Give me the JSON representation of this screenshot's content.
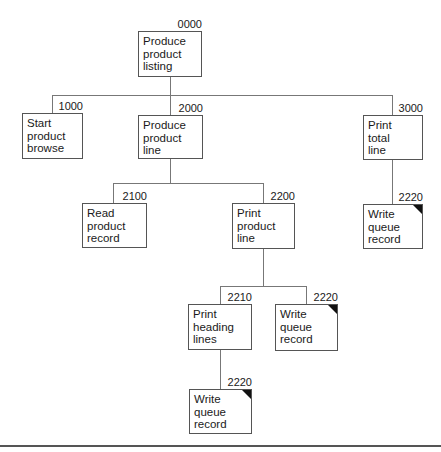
{
  "diagram": {
    "type": "structure-chart",
    "nodes": [
      {
        "id": "root",
        "number": "0000",
        "label": "Produce\nproduct\nlisting",
        "x": 138,
        "y": 31,
        "w": 64,
        "h": 46,
        "shared": false
      },
      {
        "id": "n1000",
        "number": "1000",
        "label": "Start\nproduct\nbrowse",
        "x": 22,
        "y": 113,
        "w": 61,
        "h": 46,
        "shared": false
      },
      {
        "id": "n2000",
        "number": "2000",
        "label": "Produce\nproduct\nline",
        "x": 138,
        "y": 115,
        "w": 65,
        "h": 44,
        "shared": false
      },
      {
        "id": "n3000",
        "number": "3000",
        "label": "Print\ntotal\nline",
        "x": 363,
        "y": 115,
        "w": 60,
        "h": 45,
        "shared": false
      },
      {
        "id": "n2220a",
        "number": "2220",
        "label": "Write\nqueue\nrecord",
        "x": 363,
        "y": 204,
        "w": 60,
        "h": 45,
        "shared": true
      },
      {
        "id": "n2100",
        "number": "2100",
        "label": "Read\nproduct\nrecord",
        "x": 82,
        "y": 203,
        "w": 65,
        "h": 45,
        "shared": false
      },
      {
        "id": "n2200",
        "number": "2200",
        "label": "Print\nproduct\nline",
        "x": 232,
        "y": 203,
        "w": 63,
        "h": 46,
        "shared": false
      },
      {
        "id": "n2210",
        "number": "2210",
        "label": "Print\nheading\nlines",
        "x": 188,
        "y": 304,
        "w": 64,
        "h": 46,
        "shared": false
      },
      {
        "id": "n2220b",
        "number": "2220",
        "label": "Write\nqueue\nrecord",
        "x": 275,
        "y": 304,
        "w": 63,
        "h": 47,
        "shared": true
      },
      {
        "id": "n2220c",
        "number": "2220",
        "label": "Write\nqueue\nrecord",
        "x": 189,
        "y": 389,
        "w": 63,
        "h": 45,
        "shared": true
      }
    ],
    "lines": [
      {
        "x": 170,
        "y": 77,
        "w": 1,
        "h": 18
      },
      {
        "x": 52,
        "y": 95,
        "w": 341,
        "h": 1
      },
      {
        "x": 52,
        "y": 95,
        "w": 1,
        "h": 18
      },
      {
        "x": 170,
        "y": 95,
        "w": 1,
        "h": 20
      },
      {
        "x": 392,
        "y": 95,
        "w": 1,
        "h": 20
      },
      {
        "x": 392,
        "y": 160,
        "w": 1,
        "h": 44
      },
      {
        "x": 170,
        "y": 159,
        "w": 1,
        "h": 24
      },
      {
        "x": 113,
        "y": 183,
        "w": 151,
        "h": 1
      },
      {
        "x": 113,
        "y": 183,
        "w": 1,
        "h": 20
      },
      {
        "x": 263,
        "y": 183,
        "w": 1,
        "h": 20
      },
      {
        "x": 263,
        "y": 249,
        "w": 1,
        "h": 37
      },
      {
        "x": 220,
        "y": 286,
        "w": 87,
        "h": 1
      },
      {
        "x": 220,
        "y": 286,
        "w": 1,
        "h": 18
      },
      {
        "x": 306,
        "y": 286,
        "w": 1,
        "h": 18
      },
      {
        "x": 220,
        "y": 350,
        "w": 1,
        "h": 39
      }
    ],
    "legend": {
      "shared_marker": "black corner triangle = repeated module"
    }
  }
}
